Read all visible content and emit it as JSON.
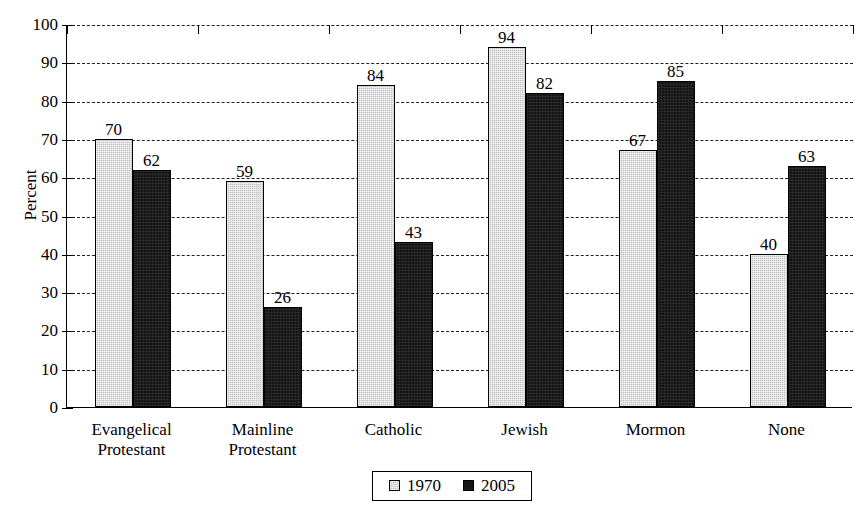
{
  "chart_data": {
    "type": "bar",
    "title": "",
    "xlabel": "",
    "ylabel": "Percent",
    "ylim": [
      0,
      100
    ],
    "ytick_step": 10,
    "yticks": [
      0,
      10,
      20,
      30,
      40,
      50,
      60,
      70,
      80,
      90,
      100
    ],
    "grid": true,
    "legend_position": "bottom-center",
    "categories": [
      "Evangelical Protestant",
      "Mainline Protestant",
      "Catholic",
      "Jewish",
      "Mormon",
      "None"
    ],
    "category_lines": [
      [
        "Evangelical",
        "Protestant"
      ],
      [
        "Mainline",
        "Protestant"
      ],
      [
        "Catholic"
      ],
      [
        "Jewish"
      ],
      [
        "Mormon"
      ],
      [
        "None"
      ]
    ],
    "series": [
      {
        "name": "1970",
        "color": "#c4c4c4",
        "values": [
          70,
          59,
          84,
          94,
          67,
          40
        ]
      },
      {
        "name": "2005",
        "color": "#151515",
        "values": [
          62,
          26,
          43,
          82,
          85,
          63
        ]
      }
    ]
  },
  "legend": {
    "items": [
      {
        "label": "1970",
        "swatch": "gray-swatch"
      },
      {
        "label": "2005",
        "swatch": "black-swatch"
      }
    ]
  }
}
